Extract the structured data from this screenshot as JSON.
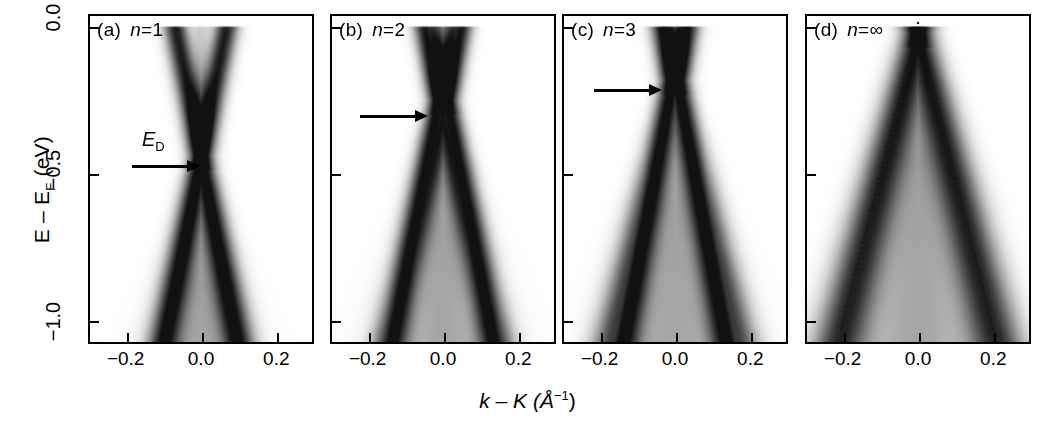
{
  "figure": {
    "background_color": "#ffffff",
    "ink_color": "#000000"
  },
  "axes": {
    "y": {
      "label": "E – E",
      "label_sub": "F",
      "label_unit": " (eV)",
      "ticks": [
        {
          "value": 0.0,
          "text": "0.0"
        },
        {
          "value": -0.5,
          "text": "−0.5"
        },
        {
          "value": -1.0,
          "text": "−1.0"
        }
      ],
      "range": [
        -1.08,
        0.04
      ]
    },
    "x": {
      "label": "k – K (Å",
      "label_sup": "−1",
      "label_tail": ")",
      "ticks": [
        {
          "value": -0.2,
          "text": "−0.2"
        },
        {
          "value": 0.0,
          "text": "0.0"
        },
        {
          "value": 0.2,
          "text": "0.2"
        }
      ],
      "range": [
        -0.3,
        0.3
      ]
    }
  },
  "panels": [
    {
      "tag": "(a)",
      "n_prefix": "n",
      "n_eq": "=",
      "n_value": "1",
      "annotation_label": "E",
      "annotation_label_sub": "D",
      "arrow": {
        "tip_energy": -0.44,
        "tip_k": -0.055,
        "length_px": 62
      }
    },
    {
      "tag": "(b)",
      "n_prefix": "n",
      "n_eq": "=",
      "n_value": "2",
      "annotation_label": "",
      "annotation_label_sub": "",
      "arrow": {
        "tip_energy": -0.25,
        "tip_k": -0.045,
        "length_px": 62
      }
    },
    {
      "tag": "(c)",
      "n_prefix": "n",
      "n_eq": "=",
      "n_value": "3",
      "annotation_label": "",
      "annotation_label_sub": "",
      "arrow": {
        "tip_energy": -0.18,
        "tip_k": -0.055,
        "length_px": 62
      }
    },
    {
      "tag": "(d)",
      "n_prefix": "n",
      "n_eq": "=",
      "n_value": "∞",
      "annotation_label": "",
      "annotation_label_sub": "",
      "arrow": null
    }
  ],
  "chart_data": {
    "type": "heatmap",
    "title": "",
    "xlabel": "k – K (Å−1)",
    "ylabel": "E – EF (eV)",
    "xlim": [
      -0.3,
      0.3
    ],
    "ylim": [
      -1.08,
      0.04
    ],
    "xticks": [
      -0.2,
      0.0,
      0.2
    ],
    "yticks": [
      0.0,
      -0.5,
      -1.0
    ],
    "grid": false,
    "legend": null,
    "colormap": "grayscale-inverted",
    "panels": [
      {
        "tag": "(a)",
        "label": "n=1",
        "layers": 1,
        "dirac_energy_eV": -0.44,
        "bands": [
          {
            "name": "pi-left",
            "slope_eV_per_invA": 6.4,
            "k_offset": 0.0,
            "side": "left",
            "width_invA": 0.03,
            "intensity": 0.95
          },
          {
            "name": "pi-right",
            "slope_eV_per_invA": 6.4,
            "k_offset": 0.0,
            "side": "right",
            "width_invA": 0.03,
            "intensity": 0.95
          }
        ],
        "band_top_splitting_invA": 0.055,
        "max_k_spread_invA": 0.105
      },
      {
        "tag": "(b)",
        "label": "n=2",
        "layers": 2,
        "dirac_energy_eV": -0.25,
        "bands": [
          {
            "name": "pi1-left",
            "slope_eV_per_invA": 6.6,
            "k_offset": -0.012,
            "side": "left",
            "width_invA": 0.028,
            "intensity": 0.95
          },
          {
            "name": "pi1-right",
            "slope_eV_per_invA": 6.6,
            "k_offset": 0.012,
            "side": "right",
            "width_invA": 0.028,
            "intensity": 0.95
          },
          {
            "name": "pi2-left",
            "slope_eV_per_invA": 5.4,
            "k_offset": 0.01,
            "side": "left",
            "width_invA": 0.03,
            "intensity": 0.8
          },
          {
            "name": "pi2-right",
            "slope_eV_per_invA": 5.4,
            "k_offset": -0.01,
            "side": "right",
            "width_invA": 0.03,
            "intensity": 0.8
          }
        ],
        "band_top_splitting_invA": 0.05,
        "max_k_spread_invA": 0.15
      },
      {
        "tag": "(c)",
        "label": "n=3",
        "layers": 3,
        "dirac_energy_eV": -0.18,
        "bands": [
          {
            "name": "pi1-left",
            "slope_eV_per_invA": 6.8,
            "k_offset": -0.008,
            "side": "left",
            "width_invA": 0.03,
            "intensity": 0.95
          },
          {
            "name": "pi1-right",
            "slope_eV_per_invA": 6.8,
            "k_offset": 0.008,
            "side": "right",
            "width_invA": 0.03,
            "intensity": 0.95
          },
          {
            "name": "pi2-left",
            "slope_eV_per_invA": 5.2,
            "k_offset": 0.004,
            "side": "left",
            "width_invA": 0.034,
            "intensity": 0.72
          },
          {
            "name": "pi2-right",
            "slope_eV_per_invA": 5.2,
            "k_offset": -0.004,
            "side": "right",
            "width_invA": 0.034,
            "intensity": 0.72
          }
        ],
        "band_top_splitting_invA": 0.048,
        "max_k_spread_invA": 0.175
      },
      {
        "tag": "(d)",
        "label": "n=∞",
        "layers": "bulk",
        "dirac_energy_eV": -0.02,
        "bands": [
          {
            "name": "pi-left",
            "slope_eV_per_invA": 5.0,
            "k_offset": 0.0,
            "side": "left",
            "width_invA": 0.042,
            "intensity": 0.85
          },
          {
            "name": "pi-right",
            "slope_eV_per_invA": 5.0,
            "k_offset": 0.0,
            "side": "right",
            "width_invA": 0.042,
            "intensity": 0.85
          }
        ],
        "guide_lines": [
          {
            "name": "dispersion-guide-left",
            "style": "dotted",
            "from": [
              0.0,
              0.02
            ],
            "to": [
              -0.21,
              -1.05
            ]
          },
          {
            "name": "dispersion-guide-right",
            "style": "dotted",
            "from": [
              0.0,
              0.02
            ],
            "to": [
              0.205,
              -1.05
            ]
          }
        ],
        "band_top_splitting_invA": 0.0,
        "max_k_spread_invA": 0.205
      }
    ],
    "annotations": [
      {
        "panel": "(a)",
        "text": "E_D",
        "type": "arrow",
        "points_to_energy_eV": -0.44
      },
      {
        "panel": "(b)",
        "text": "",
        "type": "arrow",
        "points_to_energy_eV": -0.25
      },
      {
        "panel": "(c)",
        "text": "",
        "type": "arrow",
        "points_to_energy_eV": -0.18
      }
    ]
  }
}
